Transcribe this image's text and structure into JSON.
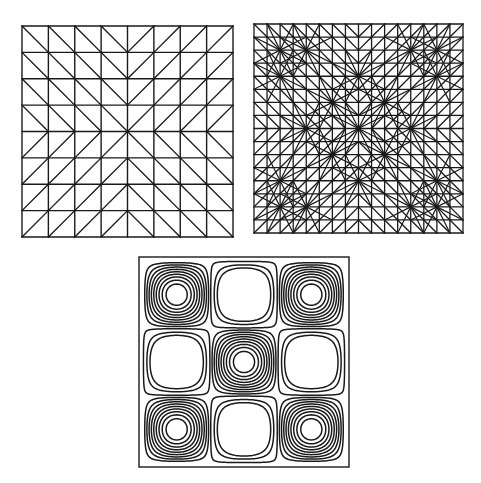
{
  "figure": {
    "panels": [
      {
        "id": "coarse-mesh",
        "kind": "triangular-mesh",
        "grid_divisions": 8,
        "diagonal_pattern": "toward-center"
      },
      {
        "id": "refined-mesh",
        "kind": "triangular-mesh",
        "grid_divisions": 16,
        "diagonal_pattern": "toward-center",
        "hub_nodes": [
          [
            8,
            8
          ],
          [
            8,
            4
          ],
          [
            4,
            8
          ],
          [
            12,
            8
          ],
          [
            8,
            12
          ],
          [
            2,
            2
          ],
          [
            2,
            14
          ],
          [
            14,
            2
          ],
          [
            14,
            14
          ],
          [
            4,
            2
          ],
          [
            2,
            4
          ],
          [
            12,
            2
          ],
          [
            14,
            4
          ],
          [
            2,
            12
          ],
          [
            4,
            14
          ],
          [
            12,
            14
          ],
          [
            14,
            12
          ],
          [
            6,
            6
          ],
          [
            10,
            6
          ],
          [
            6,
            10
          ],
          [
            10,
            10
          ]
        ]
      },
      {
        "id": "contour-plot",
        "kind": "contour",
        "function": "cos(1.5*pi*x)*cos(1.5*pi*y)",
        "domain": [
          -1,
          1
        ],
        "levels": [
          -0.32,
          -0.18,
          0.08,
          0.18,
          0.28,
          0.38,
          0.48,
          0.58,
          0.68,
          0.78,
          0.88
        ]
      }
    ],
    "colors": {
      "line": "#1a1a1a",
      "background": "#ffffff"
    }
  }
}
